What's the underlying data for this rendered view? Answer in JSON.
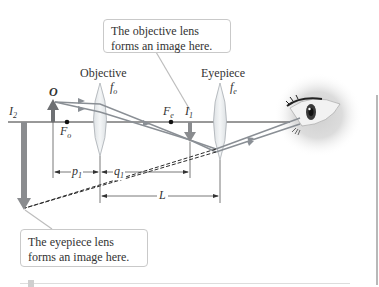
{
  "figure": {
    "labels": {
      "objective": "Objective",
      "eyepiece": "Eyepiece",
      "object": "O",
      "image2": "I",
      "image2_sub": "2",
      "image1": "I",
      "image1_sub": "1",
      "f_objective": "f",
      "f_objective_sub": "o",
      "f_eyepiece": "f",
      "f_eyepiece_sub": "e",
      "F_objective": "F",
      "F_objective_sub": "o",
      "F_eyepiece": "F",
      "F_eyepiece_sub": "e",
      "p1": "p",
      "p1_sub": "1",
      "q1": "q",
      "q1_sub": "1",
      "L": "L"
    },
    "callouts": {
      "objective_image": "The objective lens forms an image here.",
      "eyepiece_image": "The eyepiece lens forms an image here."
    },
    "colors": {
      "axis": "#333333",
      "ray": "#8a8f95",
      "arrow": "#7d7f82",
      "lens_fill": "#e9ecee",
      "lens_stroke": "#a9afb4",
      "dashed": "#2b2b2b",
      "callout_border": "#c9c9c9"
    }
  }
}
